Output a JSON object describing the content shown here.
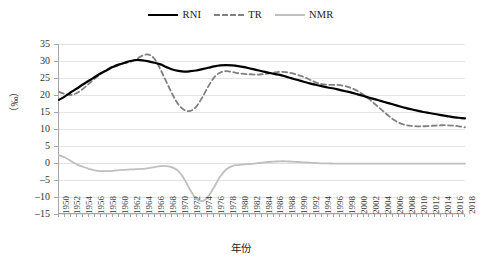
{
  "chart_data": {
    "type": "line",
    "title": "",
    "xlabel": "年份",
    "ylabel": "（‰）",
    "ylim": [
      -15,
      35
    ],
    "yticks": [
      35,
      30,
      25,
      20,
      15,
      10,
      5,
      0,
      -5,
      -10,
      -15
    ],
    "grid": true,
    "legend_position": "top-center",
    "x": [
      1950,
      1951,
      1952,
      1953,
      1954,
      1955,
      1956,
      1957,
      1958,
      1959,
      1960,
      1961,
      1962,
      1963,
      1964,
      1965,
      1966,
      1967,
      1968,
      1969,
      1970,
      1971,
      1972,
      1973,
      1974,
      1975,
      1976,
      1977,
      1978,
      1979,
      1980,
      1981,
      1982,
      1983,
      1984,
      1985,
      1986,
      1987,
      1988,
      1989,
      1990,
      1991,
      1992,
      1993,
      1994,
      1995,
      1996,
      1997,
      1998,
      1999,
      2000,
      2001,
      2002,
      2003,
      2004,
      2005,
      2006,
      2007,
      2008,
      2009,
      2010,
      2011,
      2012,
      2013,
      2014,
      2015,
      2016,
      2017,
      2018
    ],
    "xtick_labels": [
      "1950",
      "1952",
      "1954",
      "1956",
      "1958",
      "1960",
      "1962",
      "1964",
      "1966",
      "1968",
      "1970",
      "1972",
      "1974",
      "1976",
      "1978",
      "1980",
      "1982",
      "1984",
      "1986",
      "1988",
      "1990",
      "1992",
      "1994",
      "1996",
      "1998",
      "2000",
      "2002",
      "2004",
      "2006",
      "2008",
      "2010",
      "2012",
      "2014",
      "2016",
      "2018"
    ],
    "series": [
      {
        "name": "RNI",
        "color": "#000000",
        "style": "solid",
        "values": [
          18.6,
          19.6,
          20.8,
          21.9,
          23.1,
          24.2,
          25.3,
          26.4,
          27.3,
          28.2,
          28.9,
          29.5,
          30.0,
          30.3,
          30.2,
          29.9,
          29.5,
          29.0,
          28.2,
          27.5,
          27.1,
          26.9,
          27.0,
          27.2,
          27.6,
          28.0,
          28.4,
          28.7,
          28.8,
          28.7,
          28.5,
          28.2,
          27.8,
          27.4,
          27.0,
          26.6,
          26.2,
          25.9,
          25.4,
          24.9,
          24.4,
          23.9,
          23.4,
          23.0,
          22.6,
          22.2,
          21.9,
          21.5,
          21.1,
          20.7,
          20.2,
          19.7,
          19.2,
          18.7,
          18.2,
          17.7,
          17.2,
          16.7,
          16.2,
          15.8,
          15.4,
          15.0,
          14.7,
          14.4,
          14.1,
          13.8,
          13.5,
          13.3,
          13.1
        ]
      },
      {
        "name": "TR",
        "color": "#808080",
        "style": "dashed",
        "values": [
          20.9,
          20.3,
          20.0,
          20.6,
          21.8,
          23.3,
          24.8,
          26.2,
          27.4,
          28.4,
          29.1,
          29.4,
          29.8,
          30.6,
          31.6,
          31.9,
          30.6,
          27.5,
          23.8,
          20.2,
          17.2,
          15.6,
          15.3,
          16.6,
          19.3,
          22.5,
          25.2,
          26.6,
          27.0,
          26.8,
          26.4,
          26.2,
          26.1,
          26.0,
          26.1,
          26.3,
          26.6,
          26.8,
          26.7,
          26.4,
          25.9,
          25.3,
          24.5,
          23.7,
          23.2,
          23.0,
          23.0,
          22.9,
          22.6,
          22.0,
          21.2,
          20.1,
          18.7,
          17.2,
          15.7,
          14.2,
          12.8,
          11.8,
          11.2,
          10.9,
          10.8,
          10.8,
          10.9,
          11.0,
          11.1,
          11.1,
          11.0,
          10.8,
          10.5
        ]
      },
      {
        "name": "NMR",
        "color": "#bfbfbf",
        "style": "solid",
        "values": [
          2.3,
          1.6,
          0.6,
          -0.4,
          -1.1,
          -1.7,
          -2.2,
          -2.4,
          -2.4,
          -2.3,
          -2.1,
          -2.0,
          -1.9,
          -1.8,
          -1.7,
          -1.5,
          -1.2,
          -0.9,
          -0.9,
          -1.3,
          -2.4,
          -4.8,
          -8.0,
          -10.6,
          -11.2,
          -9.8,
          -7.0,
          -4.0,
          -1.9,
          -0.9,
          -0.6,
          -0.4,
          -0.3,
          -0.1,
          0.1,
          0.3,
          0.4,
          0.5,
          0.5,
          0.4,
          0.3,
          0.2,
          0.1,
          0.0,
          -0.1,
          -0.1,
          -0.2,
          -0.2,
          -0.2,
          -0.2,
          -0.2,
          -0.2,
          -0.2,
          -0.2,
          -0.2,
          -0.2,
          -0.2,
          -0.2,
          -0.2,
          -0.2,
          -0.2,
          -0.2,
          -0.2,
          -0.2,
          -0.2,
          -0.2,
          -0.2,
          -0.2,
          -0.2
        ]
      }
    ]
  },
  "legend": {
    "items": [
      {
        "label": "RNI"
      },
      {
        "label": "TR"
      },
      {
        "label": "NMR"
      }
    ]
  },
  "axes": {
    "y_title": "（‰）",
    "x_title": "年份"
  }
}
